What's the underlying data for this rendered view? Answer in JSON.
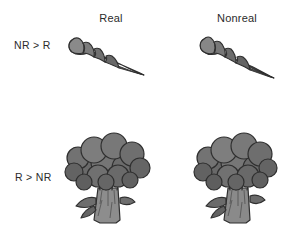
{
  "figure": {
    "background_color": "#ffffff",
    "width": 293,
    "height": 234,
    "columns": [
      {
        "id": "real",
        "label": "Real"
      },
      {
        "id": "nonreal",
        "label": "Nonreal"
      }
    ],
    "rows": [
      {
        "id": "nr-gt-r",
        "label": "NR > R"
      },
      {
        "id": "r-gt-nr",
        "label": "R > NR"
      }
    ],
    "cells": [
      {
        "row": "nr-gt-r",
        "column": "real",
        "object": "carrot",
        "name": "carrot-real-drawing"
      },
      {
        "row": "nr-gt-r",
        "column": "nonreal",
        "object": "carrot",
        "name": "carrot-nonreal-drawing"
      },
      {
        "row": "r-gt-nr",
        "column": "real",
        "object": "broccoli",
        "name": "broccoli-real-drawing"
      },
      {
        "row": "r-gt-nr",
        "column": "nonreal",
        "object": "broccoli",
        "name": "broccoli-nonreal-drawing"
      }
    ],
    "palette": {
      "outline": "#2f2f2f",
      "floret_fill": "#6e6e6e",
      "floret_fill_dark": "#5a5a5a",
      "floret_fill_light": "#828282",
      "stem_fill": "#8a8a8a",
      "stem_shade": "#636363",
      "carrot_fill": "#6f6f6f",
      "carrot_fill_light": "#888888",
      "carrot_fill_dark": "#555555",
      "text_color": "#2b2b2b"
    }
  }
}
